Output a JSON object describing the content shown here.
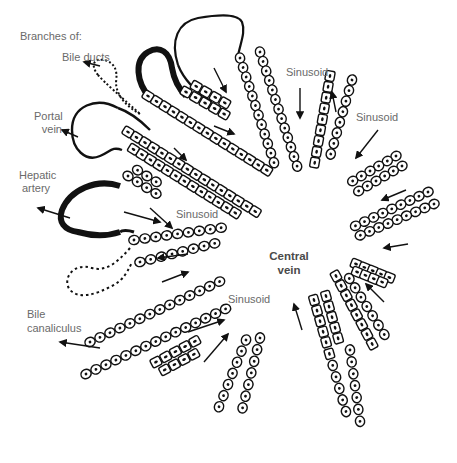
{
  "diagram": {
    "heading": "Branches of:",
    "labels": {
      "bile_ducts": "Bile ducts",
      "portal_vein_1": "Portal",
      "portal_vein_2": "vein",
      "hepatic_artery_1": "Hepatic",
      "hepatic_artery_2": "artery",
      "sinusoid_left": "Sinusoid",
      "sinusoid_top": "Sinusoid",
      "sinusoid_right": "Sinusoid",
      "sinusoid_bottom": "Sinusoid",
      "central_vein_1": "Central",
      "central_vein_2": "vein",
      "bile_canaliculus_1": "Bile",
      "bile_canaliculus_2": "canaliculus"
    },
    "colors": {
      "ink": "#111111",
      "label_text": "#6a6a6a",
      "central_label": "#4a4a4a",
      "background": "#ffffff"
    }
  }
}
